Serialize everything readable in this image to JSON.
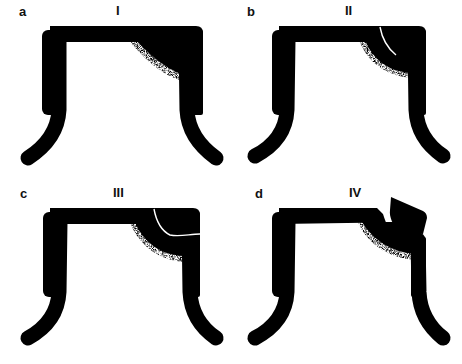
{
  "figure": {
    "panels": [
      {
        "letter": "a",
        "stage": "I",
        "description": "Crown profile with dark shaded region inside upper-right corner"
      },
      {
        "letter": "b",
        "stage": "II",
        "description": "Dark region grows; thin white crack line appears in corner"
      },
      {
        "letter": "c",
        "stage": "III",
        "description": "Crack extends across corner to outer right edge"
      },
      {
        "letter": "d",
        "stage": "IV",
        "description": "Corner fragment detached and displaced upward"
      }
    ],
    "colors": {
      "shape": "#000000",
      "background": "#ffffff",
      "crack": "#ffffff"
    }
  }
}
